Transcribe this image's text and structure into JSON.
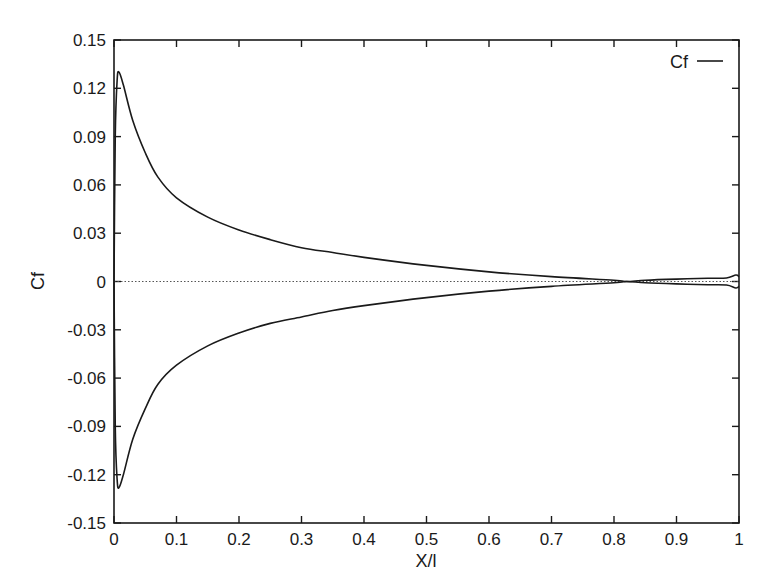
{
  "chart_data": {
    "type": "line",
    "title": "",
    "xlabel": "X/l",
    "ylabel": "Cf",
    "xlim": [
      0,
      1
    ],
    "ylim": [
      -0.15,
      0.15
    ],
    "grid": false,
    "legend": {
      "position": "top-right",
      "entries": [
        "Cf"
      ]
    },
    "x_ticks": [
      "0",
      "0.1",
      "0.2",
      "0.3",
      "0.4",
      "0.5",
      "0.6",
      "0.7",
      "0.8",
      "0.9",
      "1"
    ],
    "y_ticks": [
      "0.15",
      "0.12",
      "0.09",
      "0.06",
      "0.03",
      "0",
      "-0.03",
      "-0.06",
      "-0.09",
      "-0.12",
      "-0.15"
    ],
    "zero_line": {
      "style": "dotted",
      "y": 0
    },
    "series": [
      {
        "name": "Cf (upper surface)",
        "legend": "Cf",
        "x": [
          0,
          0.002,
          0.005,
          0.008,
          0.015,
          0.03,
          0.05,
          0.07,
          0.1,
          0.15,
          0.2,
          0.25,
          0.3,
          0.35,
          0.4,
          0.5,
          0.6,
          0.7,
          0.8,
          0.82,
          0.85,
          0.9,
          0.95,
          0.98,
          0.995,
          1.0
        ],
        "values": [
          0.0,
          0.09,
          0.125,
          0.13,
          0.122,
          0.1,
          0.08,
          0.065,
          0.052,
          0.04,
          0.032,
          0.026,
          0.021,
          0.018,
          0.015,
          0.01,
          0.006,
          0.003,
          0.0008,
          0.0,
          0.0008,
          0.0015,
          0.002,
          0.0022,
          0.004,
          0.003
        ]
      },
      {
        "name": "Cf (lower surface)",
        "legend": "",
        "x": [
          0,
          0.002,
          0.005,
          0.008,
          0.015,
          0.03,
          0.05,
          0.07,
          0.1,
          0.15,
          0.2,
          0.25,
          0.3,
          0.35,
          0.4,
          0.5,
          0.6,
          0.7,
          0.8,
          0.82,
          0.85,
          0.9,
          0.95,
          0.98,
          0.995,
          1.0
        ],
        "values": [
          0.0,
          -0.09,
          -0.123,
          -0.128,
          -0.12,
          -0.098,
          -0.079,
          -0.064,
          -0.052,
          -0.04,
          -0.032,
          -0.026,
          -0.022,
          -0.018,
          -0.015,
          -0.01,
          -0.006,
          -0.003,
          -0.0008,
          0.0,
          -0.0008,
          -0.0015,
          -0.002,
          -0.0022,
          -0.004,
          -0.003
        ]
      }
    ]
  },
  "plot_area": {
    "left": 114,
    "right": 739,
    "top": 40,
    "bottom": 523
  },
  "colors": {
    "line": "#1a1a1a",
    "frame": "#1a1a1a",
    "zero_line": "#555555",
    "background": "#ffffff"
  }
}
